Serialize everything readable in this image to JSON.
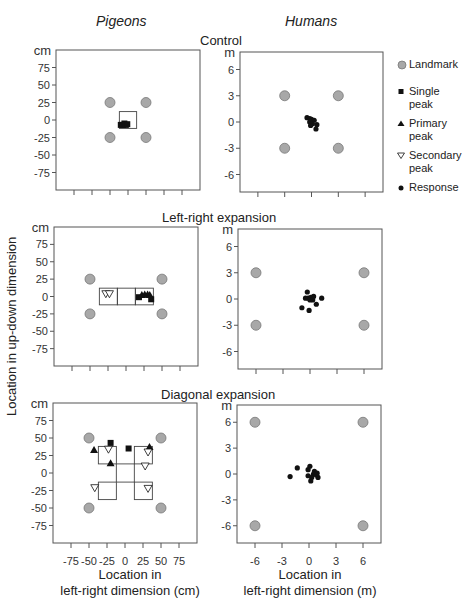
{
  "columns": {
    "left": "Pigeons",
    "right": "Humans"
  },
  "rows": [
    {
      "title": "Control"
    },
    {
      "title": "Left-right expansion"
    },
    {
      "title": "Diagonal expansion"
    }
  ],
  "axes": {
    "ylabel": "Location in up-down dimension",
    "xlabel_left_line1": "Location in",
    "xlabel_left_line2": "left-right dimension (cm)",
    "xlabel_right_line1": "Location in",
    "xlabel_right_line2": "left-right dimension (m)",
    "pigeon_unit": "cm",
    "human_unit": "m"
  },
  "legend": {
    "landmark": "Landmark",
    "single_peak_1": "Single",
    "single_peak_2": "peak",
    "primary_peak_1": "Primary",
    "primary_peak_2": "peak",
    "secondary_peak_1": "Secondary",
    "secondary_peak_2": "peak",
    "response": "Response"
  },
  "colors": {
    "landmark_fill": "#a8a8a8",
    "landmark_stroke": "#777777",
    "marker": "#111111",
    "frame": "#555555"
  },
  "chart_data": [
    {
      "type": "scatter",
      "title": "Control",
      "subject": "Pigeons",
      "xlabel": "Location in left-right dimension (cm)",
      "ylabel": "Location in up-down dimension (cm)",
      "xlim": [
        -100,
        100
      ],
      "ylim": [
        -100,
        100
      ],
      "xticks": [
        -75,
        -50,
        -25,
        0,
        25,
        50,
        75
      ],
      "yticks": [
        75,
        50,
        25,
        0,
        -25,
        -50,
        -75
      ],
      "landmarks": [
        [
          -25,
          25
        ],
        [
          25,
          25
        ],
        [
          -25,
          -25
        ],
        [
          25,
          -25
        ]
      ],
      "boxes": [
        [
          -12,
          -12,
          24,
          24
        ]
      ],
      "single_peak": [
        [
          -10,
          -7
        ],
        [
          -7,
          -7
        ],
        [
          -5,
          -5
        ],
        [
          -3,
          -7
        ],
        [
          -1,
          -6
        ]
      ],
      "primary_peak": [],
      "secondary_peak": [],
      "response": []
    },
    {
      "type": "scatter",
      "title": "Control",
      "subject": "Humans",
      "xlabel": "Location in left-right dimension (m)",
      "ylabel": "Location in up-down dimension (m)",
      "xlim": [
        -8,
        8
      ],
      "ylim": [
        -8,
        8
      ],
      "xticks": [
        -6,
        -3,
        0,
        3,
        6
      ],
      "yticks": [
        6,
        3,
        0,
        -3,
        -6
      ],
      "landmarks": [
        [
          -3,
          3
        ],
        [
          3,
          3
        ],
        [
          -3,
          -3
        ],
        [
          3,
          -3
        ]
      ],
      "response": [
        [
          -0.5,
          0.5
        ],
        [
          -0.2,
          0.4
        ],
        [
          0.0,
          0.3
        ],
        [
          0.3,
          0.2
        ],
        [
          -0.2,
          0.0
        ],
        [
          0.1,
          -0.2
        ],
        [
          -0.1,
          -0.4
        ],
        [
          0.6,
          -0.3
        ],
        [
          0.5,
          -0.8
        ]
      ]
    },
    {
      "type": "scatter",
      "title": "Left-right expansion",
      "subject": "Pigeons",
      "xlim": [
        -100,
        100
      ],
      "ylim": [
        -100,
        100
      ],
      "xticks": [
        -75,
        -50,
        -25,
        0,
        25,
        50,
        75
      ],
      "yticks": [
        75,
        50,
        25,
        0,
        -25,
        -50,
        -75
      ],
      "landmarks": [
        [
          -50,
          25
        ],
        [
          50,
          25
        ],
        [
          -50,
          -25
        ],
        [
          50,
          -25
        ]
      ],
      "boxes": [
        [
          -37,
          -12,
          25,
          24
        ],
        [
          -12,
          -12,
          25,
          24
        ],
        [
          13,
          -12,
          25,
          24
        ]
      ],
      "single_peak": [
        [
          18,
          -1
        ],
        [
          35,
          -4
        ]
      ],
      "primary_peak": [
        [
          22,
          2
        ],
        [
          26,
          3
        ],
        [
          30,
          3
        ],
        [
          33,
          2
        ]
      ],
      "secondary_peak": [
        [
          -28,
          4
        ],
        [
          -23,
          4
        ]
      ],
      "response": []
    },
    {
      "type": "scatter",
      "title": "Left-right expansion",
      "subject": "Humans",
      "xlim": [
        -8,
        8
      ],
      "ylim": [
        -8,
        8
      ],
      "xticks": [
        -6,
        -3,
        0,
        3,
        6
      ],
      "yticks": [
        6,
        3,
        0,
        -3,
        -6
      ],
      "landmarks": [
        [
          -6,
          3
        ],
        [
          6,
          3
        ],
        [
          -6,
          -3
        ],
        [
          6,
          -3
        ]
      ],
      "response": [
        [
          -0.3,
          0.8
        ],
        [
          -0.5,
          0.1
        ],
        [
          -0.2,
          0.1
        ],
        [
          0.1,
          0.2
        ],
        [
          0.4,
          0.3
        ],
        [
          0.3,
          -0.1
        ],
        [
          0.0,
          -0.1
        ],
        [
          1.3,
          0.1
        ],
        [
          0.7,
          -0.6
        ],
        [
          -0.9,
          -1.0
        ],
        [
          -0.1,
          -1.3
        ]
      ]
    },
    {
      "type": "scatter",
      "title": "Diagonal expansion",
      "subject": "Pigeons",
      "xlim": [
        -100,
        100
      ],
      "ylim": [
        -100,
        100
      ],
      "xticks": [
        -75,
        -50,
        -25,
        0,
        25,
        50,
        75
      ],
      "yticks": [
        75,
        50,
        25,
        0,
        -25,
        -50,
        -75
      ],
      "landmarks": [
        [
          -50,
          50
        ],
        [
          50,
          50
        ],
        [
          -50,
          -50
        ],
        [
          50,
          -50
        ]
      ],
      "boxes": [
        [
          -37,
          13,
          25,
          25
        ],
        [
          13,
          13,
          25,
          25
        ],
        [
          -37,
          -38,
          25,
          25
        ],
        [
          13,
          -38,
          25,
          25
        ]
      ],
      "lines": [
        [
          -12,
          13,
          13,
          13
        ],
        [
          -12,
          -13,
          13,
          -13
        ],
        [
          -12,
          13,
          -12,
          -13
        ],
        [
          13,
          13,
          13,
          -13
        ]
      ],
      "single_peak": [
        [
          -20,
          43
        ],
        [
          5,
          35
        ]
      ],
      "primary_peak": [
        [
          -43,
          33
        ],
        [
          -20,
          14
        ],
        [
          34,
          37
        ]
      ],
      "secondary_peak": [
        [
          -23,
          34
        ],
        [
          32,
          30
        ],
        [
          28,
          10
        ],
        [
          -42,
          -21
        ],
        [
          32,
          -22
        ]
      ],
      "response": []
    },
    {
      "type": "scatter",
      "title": "Diagonal expansion",
      "subject": "Humans",
      "xlim": [
        -8,
        8
      ],
      "ylim": [
        -8,
        8
      ],
      "xticks": [
        -6,
        -3,
        0,
        3,
        6
      ],
      "yticks": [
        6,
        3,
        0,
        -3,
        -6
      ],
      "landmarks": [
        [
          -6,
          6
        ],
        [
          6,
          6
        ],
        [
          -6,
          -6
        ],
        [
          6,
          -6
        ]
      ],
      "response": [
        [
          -1.3,
          0.7
        ],
        [
          -2.1,
          -0.3
        ],
        [
          0.1,
          0.9
        ],
        [
          -0.1,
          0.5
        ],
        [
          0.6,
          0.3
        ],
        [
          0.9,
          0.1
        ],
        [
          0.5,
          0.0
        ],
        [
          -0.1,
          -0.2
        ],
        [
          0.3,
          -0.4
        ],
        [
          1.0,
          -0.4
        ],
        [
          0.2,
          -0.8
        ],
        [
          0.8,
          -0.1
        ]
      ]
    }
  ]
}
